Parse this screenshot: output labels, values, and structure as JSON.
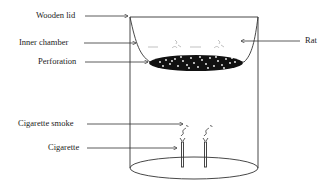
{
  "diagram": {
    "type": "apparatus-schematic",
    "labels": {
      "wooden_lid": "Wooden lid",
      "inner_chamber": "Inner chamber",
      "perforation": "Perforation",
      "rat": "Rat",
      "cigarette_smoke": "Cigarette smoke",
      "cigarette": "Cigarette"
    },
    "components": [
      {
        "id": "wooden-lid",
        "label": "Wooden lid"
      },
      {
        "id": "inner-chamber",
        "label": "Inner chamber"
      },
      {
        "id": "perforated-floor",
        "label": "Perforation"
      },
      {
        "id": "rats",
        "label": "Rat",
        "count": 2
      },
      {
        "id": "cigarettes",
        "label": "Cigarette",
        "count": 2
      },
      {
        "id": "smoke",
        "label": "Cigarette smoke"
      }
    ],
    "colors": {
      "line": "#333333",
      "fill": "#111111",
      "background": "#ffffff"
    }
  }
}
